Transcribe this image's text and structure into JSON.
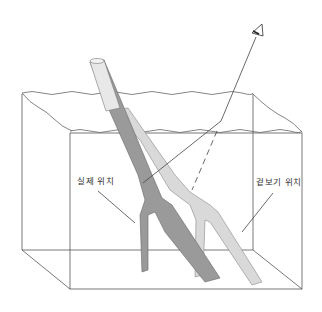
{
  "diagram": {
    "labels": {
      "actual_position": "실제 위치",
      "apparent_position": "겉보기 위치"
    },
    "elements": [
      "water-tank",
      "water-surface",
      "actual-stick",
      "apparent-stick",
      "eye",
      "sight-line",
      "dashed-extension"
    ],
    "colors": {
      "line": "#555555",
      "actual_stick": "#8a8a8a",
      "apparent_stick": "#d6d6d6",
      "background": "#ffffff"
    }
  }
}
